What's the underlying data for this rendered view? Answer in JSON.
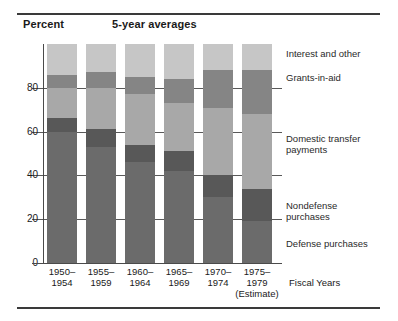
{
  "figure": {
    "axis_title": "Percent",
    "subtitle": "5-year averages",
    "x_axis_title": "Fiscal Years"
  },
  "chart_data": {
    "type": "bar",
    "stacked": true,
    "title": "5-year averages",
    "xlabel": "Fiscal Years",
    "ylabel": "Percent",
    "ylim": [
      0,
      100
    ],
    "ytick_values": [
      0,
      20,
      40,
      60,
      80
    ],
    "ytick_labels": [
      "0",
      "20",
      "40",
      "60",
      "80"
    ],
    "grid": true,
    "legend_position": "right",
    "categories": [
      "1950–1954",
      "1955–1959",
      "1960–1964",
      "1965–1969",
      "1970–1974",
      "1975–1979"
    ],
    "category_notes": [
      "",
      "",
      "",
      "",
      "",
      "(Estimate)"
    ],
    "series": [
      {
        "name": "Defense purchases",
        "color": "#6b6b6b",
        "values": [
          60,
          53,
          46,
          42,
          30,
          19
        ]
      },
      {
        "name": "Nondefense purchases",
        "color": "#585858",
        "values": [
          6,
          8,
          8,
          9,
          10,
          15
        ]
      },
      {
        "name": "Domestic transfer payments",
        "color": "#a8a8a8",
        "values": [
          14,
          19,
          23,
          22,
          31,
          34
        ]
      },
      {
        "name": "Grants-in-aid",
        "color": "#858585",
        "values": [
          6,
          7,
          8,
          11,
          17,
          20
        ]
      },
      {
        "name": "Interest and other",
        "color": "#c6c6c6",
        "values": [
          14,
          13,
          15,
          16,
          12,
          12
        ]
      }
    ]
  },
  "legend": {
    "items": [
      {
        "label": "Interest and other"
      },
      {
        "label": "Grants-in-aid"
      },
      {
        "label": "Domestic transfer"
      },
      {
        "label": "payments"
      },
      {
        "label": "Nondefense"
      },
      {
        "label": "purchases"
      },
      {
        "label": "Defense purchases"
      }
    ]
  }
}
